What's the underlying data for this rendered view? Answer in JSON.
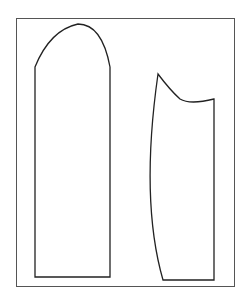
{
  "diagram": {
    "frame": {
      "x": 16,
      "y": 18,
      "width": 218,
      "height": 268,
      "stroke": "#555555"
    },
    "stroke_color": "#222222",
    "pieces": [
      {
        "name": "sleeve-piece",
        "path": "M35 67 Q 50 30 78 24 Q 102 24 110 67 L 110 277 L 35 277 Z"
      },
      {
        "name": "bodice-piece",
        "path": "M158 74 Q 170 90 180 99 Q 190 105 214 99 L 214 280 L 163 280 Q 140 200 158 74 Z"
      }
    ]
  }
}
